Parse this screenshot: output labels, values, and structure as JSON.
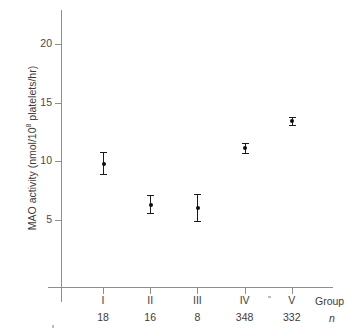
{
  "chart_data": {
    "type": "scatter",
    "title": "",
    "xlabel": "Group",
    "ylabel": "MAO activity (nmol/10⁸ platelets/hr)",
    "ylabel_prefix": "MAO activity (nmol/10",
    "ylabel_exponent": "8",
    "ylabel_suffix": " platelets/hr)",
    "categories": [
      "I",
      "II",
      "III",
      "IV",
      "V"
    ],
    "n_label": "n",
    "n_values": [
      18,
      16,
      8,
      348,
      332
    ],
    "values": [
      9.8,
      6.3,
      6.0,
      11.1,
      13.4
    ],
    "err_low": [
      8.9,
      5.6,
      4.9,
      10.7,
      13.1
    ],
    "err_high": [
      10.8,
      7.1,
      7.2,
      11.6,
      13.8
    ],
    "ylim": [
      0,
      22.5
    ],
    "yticks": [
      5,
      10,
      15,
      20
    ],
    "ytick_labels": [
      "5",
      "10",
      "15",
      "20"
    ],
    "grid": false,
    "legend": "none",
    "marker_color": "#0d0d0d",
    "axis_color": "#8e8e8e",
    "text_color": "#3c3c3c"
  },
  "axis": {
    "group_caption": "Group",
    "n_caption": "n"
  }
}
